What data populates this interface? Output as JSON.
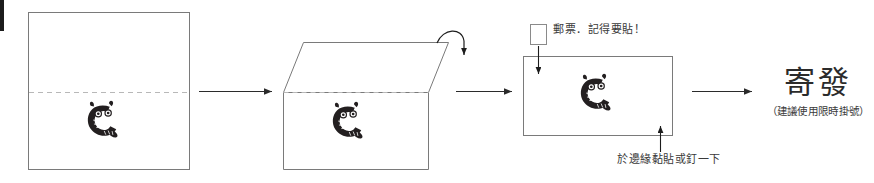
{
  "diagram": {
    "title_implied": "envelope-folding-and-mailing-instructions",
    "steps": [
      {
        "id": "step-1",
        "name": "flat-sheet-with-fold-line",
        "shape": "square",
        "has_fold_line": true,
        "logo": "cat-c-logo"
      },
      {
        "id": "step-2",
        "name": "folding-flap-over",
        "shape": "rectangle-with-parallelogram-flap",
        "has_fold_line": true,
        "has_curved-fold-arrow": true,
        "logo": "cat-c-logo"
      },
      {
        "id": "step-3",
        "name": "sealed-envelope",
        "shape": "rectangle",
        "logo": "cat-c-logo"
      },
      {
        "id": "step-4",
        "name": "mail-it-out",
        "shape": "text"
      }
    ]
  },
  "annotations": {
    "stamp_label": "郵票．記得要貼！",
    "seal_label": "於邊緣黏貼或釘一下",
    "stamp_box": "",
    "send_title": "寄發",
    "send_subtitle": "（建議使用限時掛號）"
  },
  "colors": {
    "outline": "#7a7a7a",
    "fold_line": "#b8b8b8",
    "arrow": "#2b2b2b",
    "logo": "#231f20",
    "text": "#3a3a3a",
    "heading": "#2b2b2b",
    "background": "#ffffff",
    "edge_mark": "#1c1c1c"
  }
}
